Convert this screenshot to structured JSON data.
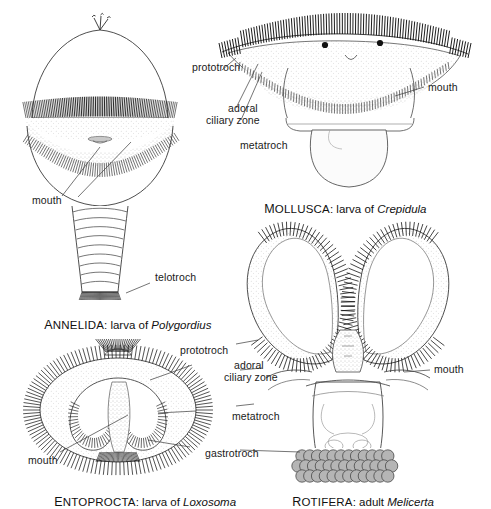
{
  "figure": {
    "background_color": "#ffffff",
    "ink_color": "#1a1a1a",
    "stipple_color": "#9a9a9a",
    "pellet_color": "#b5b5b5"
  },
  "panels": [
    {
      "id": "annelida",
      "caption": {
        "taxon_first": "A",
        "taxon_rest": "NNELIDA",
        "connector": ": larva of ",
        "species": "Polygordius"
      },
      "labels": [
        {
          "name": "mouth",
          "text": "mouth"
        },
        {
          "name": "telotroch",
          "text": "telotroch"
        }
      ]
    },
    {
      "id": "mollusca",
      "caption": {
        "taxon_first": "M",
        "taxon_rest": "OLLUSCA",
        "connector": ": larva of ",
        "species": "Crepidula"
      },
      "labels": [
        {
          "name": "mouth",
          "text": "mouth"
        }
      ]
    },
    {
      "id": "entoprocta",
      "caption": {
        "taxon_first": "E",
        "taxon_rest": "NTOPROCTA",
        "connector": ": larva of ",
        "species": "Loxosoma"
      },
      "labels": [
        {
          "name": "mouth",
          "text": "mouth"
        },
        {
          "name": "gastrotroch",
          "text": "gastrotroch"
        }
      ]
    },
    {
      "id": "rotifera",
      "caption": {
        "taxon_first": "R",
        "taxon_rest": "OTIFERA",
        "connector": ": adult ",
        "species": "Melicerta"
      },
      "labels": [
        {
          "name": "mouth",
          "text": "mouth"
        }
      ]
    }
  ],
  "shared_labels_upper": {
    "prototroch": "prototroch",
    "adoral_line1": "adoral",
    "adoral_line2": "ciliary zone",
    "metatroch": "metatroch"
  },
  "shared_labels_lower": {
    "prototroch": "prototroch",
    "adoral_line1": "adoral",
    "adoral_line2": "ciliary zone",
    "metatroch": "metatroch",
    "gastrotroch": "gastrotroch"
  }
}
